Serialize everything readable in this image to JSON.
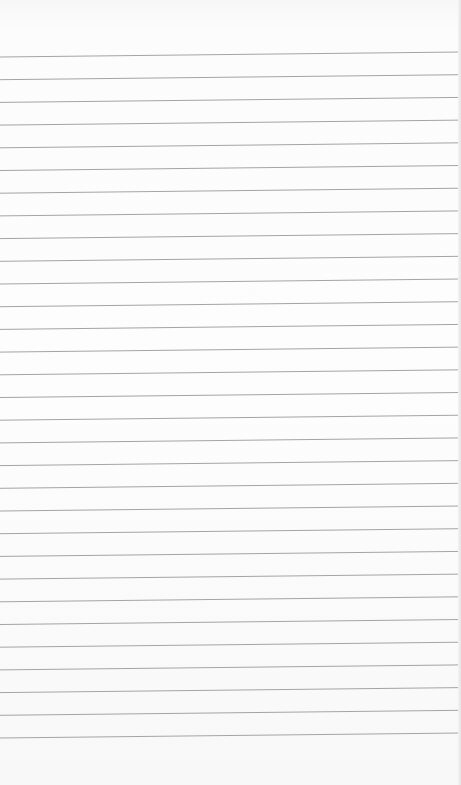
{
  "paper": {
    "type": "ruled-notebook-page",
    "background_color": "#fbfbfb",
    "line_color": "#a4a4a4",
    "line_count": 31,
    "first_line_y_left": 57,
    "first_line_y_right": 52,
    "line_spacing": 22.7,
    "text": ""
  }
}
